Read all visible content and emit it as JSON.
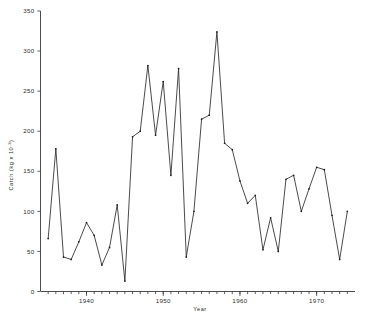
{
  "chart_data": {
    "type": "line",
    "title": "",
    "xlabel": "Year",
    "ylabel": "Catch  (kg x 10",
    "ylabel_exponent": "-3",
    "ylabel_close": ")",
    "xlim": [
      1934,
      1975
    ],
    "ylim": [
      0,
      350
    ],
    "grid": false,
    "legend": "none",
    "y_ticks": [
      0,
      50,
      100,
      150,
      200,
      250,
      300,
      350
    ],
    "y_ticklabels": [
      "0",
      "50",
      "100",
      "150",
      "200",
      "250",
      "300",
      "350"
    ],
    "x_ticks": [
      1940,
      1950,
      1960,
      1970
    ],
    "x_ticklabels": [
      "1940",
      "1950",
      "1960",
      "1970"
    ],
    "x_minor_tick_step": 1,
    "x_minor_start": 1935,
    "x_minor_end": 1974,
    "marker": "dot",
    "line_color": "#2b2b2b",
    "series": [
      {
        "name": "Catch",
        "x": [
          1935,
          1936,
          1937,
          1938,
          1939,
          1940,
          1941,
          1942,
          1943,
          1944,
          1945,
          1946,
          1947,
          1948,
          1949,
          1950,
          1951,
          1952,
          1953,
          1954,
          1955,
          1956,
          1957,
          1958,
          1959,
          1960,
          1961,
          1962,
          1963,
          1964,
          1965,
          1966,
          1967,
          1968,
          1969,
          1970,
          1971,
          1972,
          1973,
          1974
        ],
        "values": [
          66,
          178,
          43,
          40,
          62,
          86,
          70,
          33,
          55,
          108,
          13,
          193,
          200,
          282,
          195,
          262,
          145,
          278,
          43,
          100,
          215,
          220,
          324,
          185,
          177,
          138,
          110,
          120,
          52,
          92,
          50,
          140,
          145,
          100,
          128,
          155,
          152,
          95,
          40,
          100
        ]
      }
    ]
  }
}
